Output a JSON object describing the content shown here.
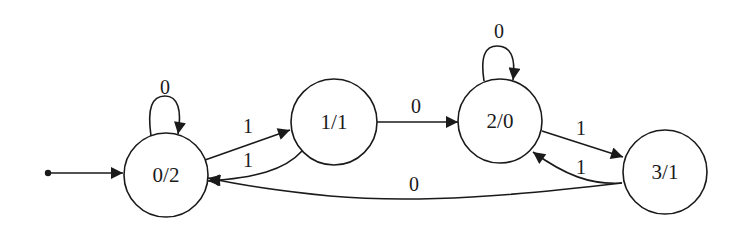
{
  "diagram": {
    "type": "finite-state-machine",
    "start_state": "0/2",
    "states": [
      {
        "id": "s0",
        "label": "0/2",
        "cx": 166,
        "cy": 175,
        "r": 42
      },
      {
        "id": "s1",
        "label": "1/1",
        "cx": 334,
        "cy": 122,
        "r": 43
      },
      {
        "id": "s2",
        "label": "2/0",
        "cx": 500,
        "cy": 121,
        "r": 42
      },
      {
        "id": "s3",
        "label": "3/1",
        "cx": 665,
        "cy": 172,
        "r": 42
      }
    ],
    "transitions": [
      {
        "from": "0/2",
        "to": "0/2",
        "label": "0"
      },
      {
        "from": "0/2",
        "to": "1/1",
        "label": "1"
      },
      {
        "from": "1/1",
        "to": "0/2",
        "label": "1"
      },
      {
        "from": "1/1",
        "to": "2/0",
        "label": "0"
      },
      {
        "from": "2/0",
        "to": "2/0",
        "label": "0"
      },
      {
        "from": "2/0",
        "to": "3/1",
        "label": "1"
      },
      {
        "from": "3/1",
        "to": "2/0",
        "label": "1"
      },
      {
        "from": "3/1",
        "to": "0/2",
        "label": "0"
      }
    ],
    "colors": {
      "stroke": "#1a1a1a",
      "background": "#ffffff"
    }
  }
}
